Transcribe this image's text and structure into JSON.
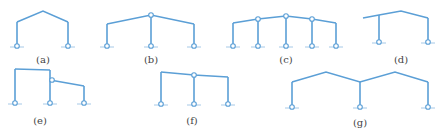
{
  "figure": {
    "line_color": "#5b9fd6",
    "panels": [
      {
        "id": "a",
        "label": "(a)",
        "type": "single-span gable frame, pinned bases",
        "beam": [
          [
            17,
            22
          ],
          [
            43,
            11
          ],
          [
            68,
            22
          ]
        ],
        "columns": [
          [
            17,
            22,
            17,
            46
          ],
          [
            68,
            22,
            68,
            46
          ]
        ],
        "supports": [
          [
            17,
            46
          ],
          [
            68,
            46
          ]
        ],
        "hinges": [],
        "label_pos": [
          43,
          63
        ]
      },
      {
        "id": "b",
        "label": "(b)",
        "type": "two-span gable frame with pinned central column",
        "beam": [
          [
            107,
            24
          ],
          [
            151,
            15
          ],
          [
            194,
            24
          ]
        ],
        "columns": [
          [
            107,
            24,
            107,
            46
          ],
          [
            151,
            15,
            151,
            46
          ],
          [
            194,
            24,
            194,
            46
          ]
        ],
        "supports": [
          [
            107,
            46
          ],
          [
            151,
            46
          ],
          [
            194,
            46
          ]
        ],
        "hinges": [
          [
            151,
            15
          ]
        ],
        "label_pos": [
          151,
          63
        ]
      },
      {
        "id": "c",
        "label": "(c)",
        "type": "four-span gable frame with pinned interior columns",
        "beam": [
          [
            233,
            23
          ],
          [
            258,
            19
          ],
          [
            286,
            16
          ],
          [
            312,
            19
          ],
          [
            336,
            23
          ]
        ],
        "columns": [
          [
            233,
            23,
            233,
            46
          ],
          [
            258,
            19,
            258,
            46
          ],
          [
            286,
            16,
            286,
            46
          ],
          [
            312,
            19,
            312,
            46
          ],
          [
            336,
            23,
            336,
            46
          ]
        ],
        "supports": [
          [
            233,
            46
          ],
          [
            258,
            46
          ],
          [
            286,
            46
          ],
          [
            312,
            46
          ],
          [
            336,
            46
          ]
        ],
        "hinges": [
          [
            258,
            19
          ],
          [
            286,
            16
          ],
          [
            312,
            19
          ]
        ],
        "label_pos": [
          286,
          63
        ]
      },
      {
        "id": "d",
        "label": "(d)",
        "type": "gable frame with cantilever overhang",
        "beam": [
          [
            363,
            18
          ],
          [
            379,
            15
          ],
          [
            401,
            11
          ],
          [
            428,
            18
          ]
        ],
        "columns": [
          [
            379,
            15,
            379,
            42
          ],
          [
            428,
            18,
            428,
            42
          ]
        ],
        "supports": [
          [
            379,
            42
          ],
          [
            428,
            42
          ]
        ],
        "hinges": [],
        "label_pos": [
          401,
          63
        ]
      },
      {
        "id": "e",
        "label": "(e)",
        "type": "high-low two-span frame with hinged lower span",
        "beam": [
          [
            15,
            69
          ],
          [
            50,
            70
          ]
        ],
        "beam2": [
          [
            50,
            80
          ],
          [
            84,
            86
          ]
        ],
        "columns": [
          [
            15,
            69,
            15,
            103
          ],
          [
            50,
            70,
            50,
            103
          ],
          [
            84,
            86,
            84,
            103
          ]
        ],
        "supports": [
          [
            15,
            103
          ],
          [
            50,
            103
          ],
          [
            84,
            103
          ]
        ],
        "hinges": [
          [
            52,
            80
          ]
        ],
        "label_pos": [
          40,
          124
        ]
      },
      {
        "id": "f",
        "label": "(f)",
        "type": "two-span mono-pitch frame with pinned central column",
        "beam": [
          [
            161,
            72
          ],
          [
            194,
            75
          ],
          [
            228,
            77
          ]
        ],
        "columns": [
          [
            161,
            72,
            161,
            104
          ],
          [
            194,
            75,
            194,
            104
          ],
          [
            228,
            77,
            228,
            104
          ]
        ],
        "supports": [
          [
            161,
            104
          ],
          [
            194,
            104
          ],
          [
            228,
            104
          ]
        ],
        "hinges": [
          [
            194,
            75
          ]
        ],
        "label_pos": [
          192,
          124
        ]
      },
      {
        "id": "g",
        "label": "(g)",
        "type": "double-gable two-span frame (M-shaped roof)",
        "beam": [
          [
            292,
            82
          ],
          [
            326,
            72
          ],
          [
            360,
            82
          ],
          [
            395,
            72
          ],
          [
            428,
            82
          ]
        ],
        "columns": [
          [
            292,
            82,
            292,
            107
          ],
          [
            360,
            82,
            360,
            107
          ],
          [
            428,
            82,
            428,
            107
          ]
        ],
        "supports": [
          [
            292,
            107
          ],
          [
            360,
            107
          ],
          [
            428,
            107
          ]
        ],
        "hinges": [],
        "label_pos": [
          360,
          126
        ]
      }
    ]
  }
}
